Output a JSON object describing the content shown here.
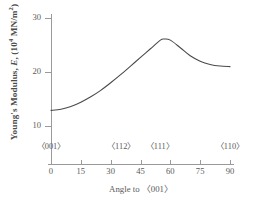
{
  "chart_data": {
    "type": "line",
    "title": "",
    "xlabel": "Angle to 〈001〉",
    "ylabel": "Young's Modulus, E, (10⁴ MN/m²)",
    "ylabel_parts": {
      "prefix": "Young's Modulus, ",
      "symbol": "E",
      "middle": ", (10",
      "exponent": "4",
      "suffix": " MN/m",
      "unit_exponent": "2",
      "close": ")"
    },
    "xlim": [
      0,
      90
    ],
    "ylim": [
      5,
      32
    ],
    "grid": false,
    "legend": null,
    "xticks": [
      0,
      15,
      30,
      45,
      60,
      75,
      90
    ],
    "xticklabels": [
      "0",
      "15",
      "30",
      "45",
      "60",
      "75",
      "90"
    ],
    "yticks": [
      10,
      20,
      30
    ],
    "yticklabels": [
      "10",
      "20",
      "30"
    ],
    "direction_labels": [
      {
        "label": "〈001〉",
        "angle": 0
      },
      {
        "label": "〈112〉",
        "angle": 35.3
      },
      {
        "label": "〈111〉",
        "angle": 54.7
      },
      {
        "label": "〈110〉",
        "angle": 90
      }
    ],
    "x": [
      0,
      5,
      10,
      15,
      20,
      25,
      30,
      35,
      40,
      45,
      50,
      55,
      57,
      60,
      65,
      70,
      75,
      80,
      85,
      90
    ],
    "values": [
      12.9,
      13.1,
      13.6,
      14.4,
      15.4,
      16.6,
      18.0,
      19.5,
      21.1,
      22.7,
      24.3,
      25.9,
      26.1,
      25.9,
      24.5,
      23.0,
      22.0,
      21.4,
      21.1,
      21.0
    ],
    "series": [
      {
        "name": "Young's Modulus",
        "color": "#4a4a4a",
        "values": [
          12.9,
          13.1,
          13.6,
          14.4,
          15.4,
          16.6,
          18.0,
          19.5,
          21.1,
          22.7,
          24.3,
          25.9,
          26.1,
          25.9,
          24.5,
          23.0,
          22.0,
          21.4,
          21.1,
          21.0
        ]
      }
    ],
    "annotations": []
  },
  "colors": {
    "axis": "#9a9a9a",
    "curve": "#4a4a4a",
    "text": "#5a5a5a",
    "background": "#ffffff"
  }
}
